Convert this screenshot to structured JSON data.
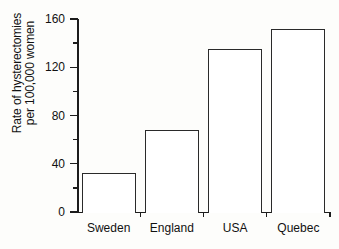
{
  "chart_data": {
    "type": "bar",
    "title": "",
    "xlabel": "",
    "ylabel": "Rate of hysterectomies per 100,000 women",
    "ylabel_line1": "Rate of hysterectomies",
    "ylabel_line2": "per 100,000 women",
    "categories": [
      "Sweden",
      "England",
      "USA",
      "Quebec"
    ],
    "values": [
      32,
      68,
      135,
      152
    ],
    "ylim": [
      0,
      160
    ],
    "ytick_labels": [
      "0",
      "40",
      "80",
      "120",
      "160"
    ],
    "ytick_values": [
      0,
      40,
      80,
      120,
      160
    ],
    "yminor_values": [
      20,
      60,
      100,
      140
    ],
    "grid": false,
    "legend": false,
    "bar_fill": "#ffffff",
    "bar_edge": "#2a2a2a",
    "axis_color": "#1c1c1c",
    "background": "#fdfdfb"
  }
}
